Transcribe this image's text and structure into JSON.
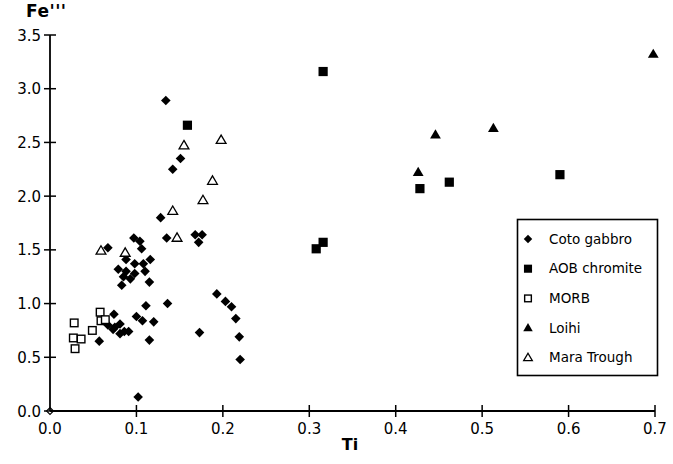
{
  "colors": {
    "foreground": "#000000",
    "background": "#ffffff"
  },
  "chart_data": {
    "type": "scatter",
    "title": "",
    "xlabel": "Ti",
    "ylabel": "Fe'''",
    "xlim": [
      0.0,
      0.7
    ],
    "ylim": [
      0.0,
      3.5
    ],
    "x_ticks": [
      0.0,
      0.1,
      0.2,
      0.3,
      0.4,
      0.5,
      0.6,
      0.7
    ],
    "x_tick_labels": [
      "0.0",
      "0.1",
      "0.2",
      "0.3",
      "0.4",
      "0.5",
      "0.6",
      "0.7"
    ],
    "y_ticks": [
      0.0,
      0.5,
      1.0,
      1.5,
      2.0,
      2.5,
      3.0,
      3.5
    ],
    "y_tick_labels": [
      "0.0",
      "0.5",
      "1.0",
      "1.5",
      "2.0",
      "2.5",
      "3.0",
      "3.5"
    ],
    "grid": false,
    "legend_position": "right-middle",
    "origin_marker": {
      "x": 0.0,
      "y": 0.0,
      "marker": "open-diamond"
    },
    "series": [
      {
        "name": "Coto gabbro",
        "marker": "filled-diamond",
        "color": "#000000",
        "points": [
          [
            0.134,
            2.89
          ],
          [
            0.151,
            2.35
          ],
          [
            0.142,
            2.25
          ],
          [
            0.128,
            1.8
          ],
          [
            0.097,
            1.61
          ],
          [
            0.104,
            1.58
          ],
          [
            0.135,
            1.61
          ],
          [
            0.168,
            1.64
          ],
          [
            0.176,
            1.64
          ],
          [
            0.172,
            1.57
          ],
          [
            0.067,
            1.52
          ],
          [
            0.106,
            1.51
          ],
          [
            0.088,
            1.41
          ],
          [
            0.116,
            1.41
          ],
          [
            0.098,
            1.37
          ],
          [
            0.108,
            1.37
          ],
          [
            0.079,
            1.32
          ],
          [
            0.088,
            1.3
          ],
          [
            0.11,
            1.3
          ],
          [
            0.098,
            1.28
          ],
          [
            0.085,
            1.25
          ],
          [
            0.093,
            1.23
          ],
          [
            0.115,
            1.2
          ],
          [
            0.083,
            1.17
          ],
          [
            0.193,
            1.09
          ],
          [
            0.203,
            1.02
          ],
          [
            0.21,
            0.97
          ],
          [
            0.136,
            1.0
          ],
          [
            0.111,
            0.98
          ],
          [
            0.1,
            0.88
          ],
          [
            0.215,
            0.86
          ],
          [
            0.074,
            0.9
          ],
          [
            0.107,
            0.84
          ],
          [
            0.12,
            0.83
          ],
          [
            0.067,
            0.8
          ],
          [
            0.081,
            0.81
          ],
          [
            0.075,
            0.78
          ],
          [
            0.073,
            0.76
          ],
          [
            0.086,
            0.74
          ],
          [
            0.091,
            0.74
          ],
          [
            0.081,
            0.72
          ],
          [
            0.173,
            0.73
          ],
          [
            0.219,
            0.69
          ],
          [
            0.115,
            0.66
          ],
          [
            0.057,
            0.65
          ],
          [
            0.22,
            0.48
          ],
          [
            0.102,
            0.13
          ]
        ]
      },
      {
        "name": "AOB chromite",
        "marker": "filled-square",
        "color": "#000000",
        "points": [
          [
            0.159,
            2.66
          ],
          [
            0.316,
            3.16
          ],
          [
            0.308,
            1.51
          ],
          [
            0.316,
            1.57
          ],
          [
            0.428,
            2.07
          ],
          [
            0.462,
            2.13
          ],
          [
            0.59,
            2.2
          ]
        ]
      },
      {
        "name": "MORB",
        "marker": "open-square",
        "color": "#000000",
        "points": [
          [
            0.058,
            0.92
          ],
          [
            0.059,
            0.84
          ],
          [
            0.064,
            0.85
          ],
          [
            0.028,
            0.82
          ],
          [
            0.049,
            0.75
          ],
          [
            0.027,
            0.68
          ],
          [
            0.036,
            0.67
          ],
          [
            0.029,
            0.58
          ]
        ]
      },
      {
        "name": "Loihi",
        "marker": "filled-triangle",
        "color": "#000000",
        "points": [
          [
            0.426,
            2.22
          ],
          [
            0.446,
            2.57
          ],
          [
            0.513,
            2.63
          ],
          [
            0.698,
            3.32
          ]
        ]
      },
      {
        "name": "Mara Trough",
        "marker": "open-triangle",
        "color": "#000000",
        "points": [
          [
            0.059,
            1.49
          ],
          [
            0.087,
            1.47
          ],
          [
            0.142,
            1.86
          ],
          [
            0.147,
            1.61
          ],
          [
            0.155,
            2.47
          ],
          [
            0.177,
            1.96
          ],
          [
            0.188,
            2.14
          ],
          [
            0.198,
            2.52
          ]
        ]
      }
    ]
  }
}
